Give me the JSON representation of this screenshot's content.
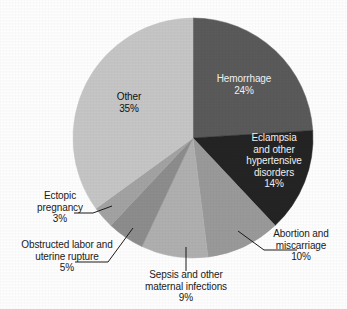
{
  "figure": {
    "background_color": "#fefefe",
    "text_color": "#1b1b1b"
  },
  "chart_data": {
    "type": "pie",
    "title": "",
    "subtitle": "",
    "xlabel": "",
    "ylabel": "",
    "grid": false,
    "legend_position": "none",
    "label_format": "name + percent",
    "start_angle_deg": 0,
    "direction": "clockwise",
    "center": [
      193,
      138
    ],
    "radius": 120,
    "categories": [
      "Hemorrhage",
      "Eclampsia and other hypertensive disorders",
      "Abortion and miscarriage",
      "Sepsis and other maternal infections",
      "Obstructed labor and uterine rupture",
      "Ectopic pregnancy",
      "Other"
    ],
    "values": [
      24,
      14,
      10,
      9,
      5,
      3,
      35
    ],
    "slices": [
      {
        "name": "Hemorrhage",
        "value": 24,
        "percent_label": "24%",
        "label_lines": [
          "Hemorrhage",
          "24%"
        ],
        "color": "#5a5a5a",
        "label_placement": "inside",
        "label_color": "#f2f2f2",
        "leader_line": false
      },
      {
        "name": "Eclampsia and other hypertensive disorders",
        "value": 14,
        "percent_label": "14%",
        "label_lines": [
          "Eclampsia",
          "and other",
          "hypertensive",
          "disorders",
          "14%"
        ],
        "color": "#242424",
        "label_placement": "inside",
        "label_color": "#f2f2f2",
        "leader_line": false
      },
      {
        "name": "Abortion and miscarriage",
        "value": 10,
        "percent_label": "10%",
        "label_lines": [
          "Abortion and",
          "miscarriage",
          "10%"
        ],
        "color": "#9a9a9a",
        "label_placement": "outside",
        "label_color": "#1b1b1b",
        "leader_line": true
      },
      {
        "name": "Sepsis and other maternal infections",
        "value": 9,
        "percent_label": "9%",
        "label_lines": [
          "Sepsis and other",
          "maternal infections",
          "9%"
        ],
        "color": "#b0b0b0",
        "label_placement": "outside",
        "label_color": "#1b1b1b",
        "leader_line": true
      },
      {
        "name": "Obstructed labor and uterine rupture",
        "value": 5,
        "percent_label": "5%",
        "label_lines": [
          "Obstructed labor and",
          "uterine rupture",
          "5%"
        ],
        "color": "#8d8d8d",
        "label_placement": "outside",
        "label_color": "#1b1b1b",
        "leader_line": true
      },
      {
        "name": "Ectopic pregnancy",
        "value": 3,
        "percent_label": "3%",
        "label_lines": [
          "Ectopic",
          "pregnancy",
          "3%"
        ],
        "color": "#a3a3a3",
        "label_placement": "outside",
        "label_color": "#1b1b1b",
        "leader_line": true
      },
      {
        "name": "Other",
        "value": 35,
        "percent_label": "35%",
        "label_lines": [
          "Other",
          "35%"
        ],
        "color": "#c6c6c6",
        "label_placement": "inside",
        "label_color": "#111111",
        "leader_line": false
      }
    ]
  },
  "labels": {
    "hemorrhage": "Hemorrhage\n24%",
    "eclampsia": "Eclampsia\nand other\nhypertensive\ndisorders\n14%",
    "abortion": "Abortion and\nmiscarriage\n10%",
    "sepsis": "Sepsis and other\nmaternal infections\n9%",
    "obstructed": "Obstructed labor and\nuterine rupture\n5%",
    "ectopic": "Ectopic\npregnancy\n3%",
    "other": "Other\n35%"
  }
}
